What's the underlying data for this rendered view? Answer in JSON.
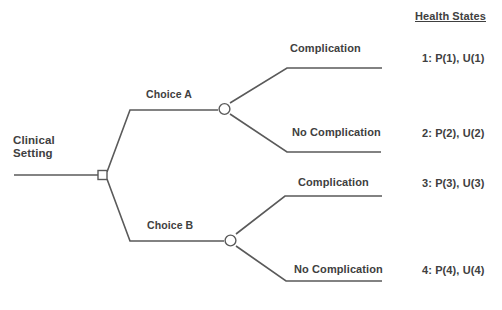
{
  "diagram": {
    "root": {
      "label": "Clinical\nSetting",
      "node_type": "decision-square"
    },
    "header": {
      "health_states_label": "Health States"
    },
    "branches": [
      {
        "choice_label": "Choice A",
        "node_type": "chance-circle",
        "outcomes": [
          {
            "label": "Complication",
            "state": "1: P(1), U(1)"
          },
          {
            "label": "No Complication",
            "state": "2: P(2), U(2)"
          }
        ]
      },
      {
        "choice_label": "Choice B",
        "node_type": "chance-circle",
        "outcomes": [
          {
            "label": "Complication",
            "state": "3: P(3), U(3)"
          },
          {
            "label": "No Complication",
            "state": "4: P(4), U(4)"
          }
        ]
      }
    ],
    "colors": {
      "background": "#ffffff",
      "line": "#5a5a5a",
      "text": "#404040",
      "node_fill": "#ffffff"
    }
  }
}
